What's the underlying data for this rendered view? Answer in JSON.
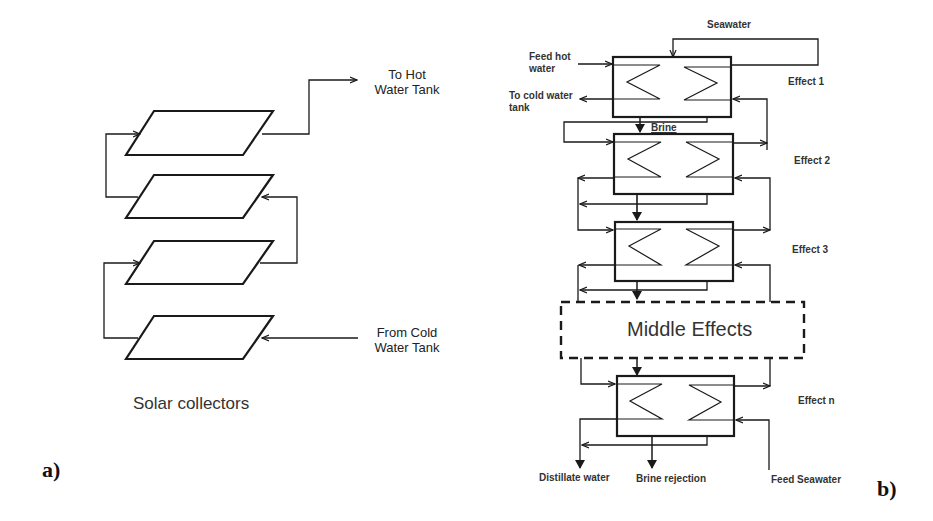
{
  "figure": {
    "panels": [
      {
        "id": "a",
        "tag": "a)",
        "title": "Solar collectors",
        "collector_count": 4,
        "labels": {
          "outlet": [
            "To Hot",
            "Water Tank"
          ],
          "inlet": [
            "From Cold",
            "Water Tank"
          ]
        }
      },
      {
        "id": "b",
        "tag": "b)",
        "middle_block": "Middle Effects",
        "effects": [
          "Effect 1",
          "Effect 2",
          "Effect 3",
          "Effect n"
        ],
        "labels": {
          "seawater": "Seawater",
          "feed_hot_water": [
            "Feed hot",
            "water"
          ],
          "to_cold_water_tank": [
            "To cold water",
            "tank"
          ],
          "brine": "Brine",
          "distillate_water": "Distillate water",
          "brine_rejection": "Brine rejection",
          "feed_seawater": "Feed Seawater"
        }
      }
    ]
  },
  "colors": {
    "line": "#1a1a1a",
    "background": "#ffffff"
  }
}
